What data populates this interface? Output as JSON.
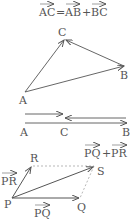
{
  "formula_top": {
    "lhs": "AC",
    "eq": "=",
    "t1": "AB",
    "plus": "+",
    "t2": "BC"
  },
  "triangle": {
    "points": {
      "A": "A",
      "B": "B",
      "C": "C"
    }
  },
  "collinear": {
    "labels": {
      "A": "A",
      "C": "C",
      "B": "B"
    }
  },
  "parallelogram": {
    "points": {
      "P": "P",
      "Q": "Q",
      "R": "R",
      "S": "S"
    },
    "vec_pr": "PR",
    "vec_pq": "PQ",
    "sum_t1": "PQ",
    "sum_plus": "+",
    "sum_t2": "PR"
  },
  "colors": {
    "stroke": "#555555",
    "dashed": "#888888"
  }
}
